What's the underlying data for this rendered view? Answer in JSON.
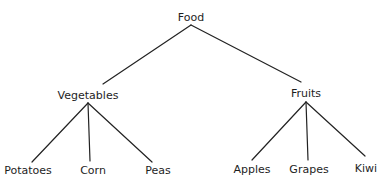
{
  "diagram": {
    "type": "tree",
    "root": {
      "label": "Food",
      "children": [
        {
          "label": "Vegetables",
          "children": [
            {
              "label": "Potatoes"
            },
            {
              "label": "Corn"
            },
            {
              "label": "Peas"
            }
          ]
        },
        {
          "label": "Fruits",
          "children": [
            {
              "label": "Apples"
            },
            {
              "label": "Grapes"
            },
            {
              "label": "Kiwi"
            }
          ]
        }
      ]
    }
  },
  "colors": {
    "line": "#222222",
    "text": "#1e1e1e",
    "background": "#ffffff"
  }
}
